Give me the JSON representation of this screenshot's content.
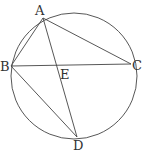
{
  "diagram": {
    "type": "inscribed-quadrilateral",
    "points": {
      "A": {
        "label": "A",
        "on_circle": true
      },
      "B": {
        "label": "B",
        "on_circle": true
      },
      "C": {
        "label": "C",
        "on_circle": true
      },
      "D": {
        "label": "D",
        "on_circle": true
      },
      "E": {
        "label": "E",
        "on_circle": false,
        "defined_as": "intersection of AD and BC"
      }
    },
    "segments": [
      {
        "from": "A",
        "to": "B"
      },
      {
        "from": "A",
        "to": "C"
      },
      {
        "from": "A",
        "to": "D"
      },
      {
        "from": "B",
        "to": "C"
      },
      {
        "from": "B",
        "to": "D"
      }
    ],
    "stroke_color": "#444444"
  }
}
